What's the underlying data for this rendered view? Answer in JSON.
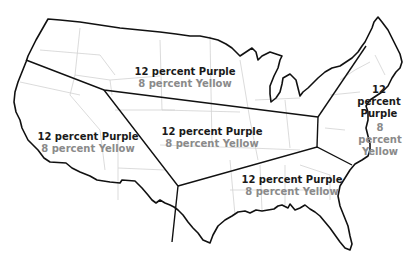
{
  "map": {
    "title": "United States regions",
    "colors": {
      "outline": "#111111",
      "state_lines": "#d0d0d0",
      "purple_text": "#1a1a1a",
      "yellow_text": "#8a8a8a"
    },
    "regions": [
      {
        "id": "north-central",
        "purple": "12 percent Purple",
        "yellow": "8 percent Yellow",
        "x": 185,
        "y": 66
      },
      {
        "id": "west",
        "purple": "12 percent Purple",
        "yellow": "8 percent Yellow",
        "x": 88,
        "y": 135
      },
      {
        "id": "central",
        "purple": "12 percent Purple",
        "yellow": "8 percent Yellow",
        "x": 212,
        "y": 130
      },
      {
        "id": "northeast",
        "purple": "12 percent Purple",
        "yellow": "",
        "x": 378,
        "y": 85
      },
      {
        "id": "mid-atlantic",
        "purple": "",
        "yellow": "8 percent Yellow",
        "x": 379,
        "y": 121
      },
      {
        "id": "southeast",
        "purple": "12 percent Purple",
        "yellow": "8 percent Yellow",
        "x": 290,
        "y": 180
      }
    ],
    "northeast_lines": [
      "12",
      "percent",
      "Purple"
    ],
    "midatlantic_lines": [
      "8",
      "percent",
      "Yellow"
    ]
  }
}
